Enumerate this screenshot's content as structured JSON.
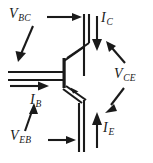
{
  "figure": {
    "device": "pnp-bipolar-junction-transistor",
    "stroke_color": "#1a1a1a",
    "background_color": "#ffffff",
    "width": 153,
    "height": 163,
    "labels": [
      {
        "id": "vbc",
        "symbol": "V",
        "subscript": "BC",
        "text": "VBC",
        "kind": "voltage",
        "meaning": "base-to-collector voltage",
        "arrow": "horizontal-right-into-collector-rail, plus diagonal down-left pointer"
      },
      {
        "id": "ic",
        "symbol": "I",
        "subscript": "C",
        "text": "IC",
        "kind": "current",
        "meaning": "collector current",
        "arrow": "vertical-down"
      },
      {
        "id": "vce",
        "symbol": "V",
        "subscript": "CE",
        "text": "VCE",
        "kind": "voltage",
        "meaning": "collector-to-emitter voltage",
        "arrow": "double-headed leader, up-left to collector and down-left to emitter"
      },
      {
        "id": "ib",
        "symbol": "I",
        "subscript": "B",
        "text": "IB",
        "kind": "current",
        "meaning": "base current",
        "arrow": "horizontal-right"
      },
      {
        "id": "ie",
        "symbol": "I",
        "subscript": "E",
        "text": "IE",
        "kind": "current",
        "meaning": "emitter current",
        "arrow": "vertical-up"
      },
      {
        "id": "veb",
        "symbol": "V",
        "subscript": "EB",
        "text": "VEB",
        "kind": "voltage",
        "meaning": "emitter-to-base voltage",
        "arrow": "horizontal-right-into-emitter-rail, plus diagonal up-right pointer"
      }
    ],
    "terminals": [
      {
        "id": "collector",
        "name": "collector",
        "position": "top-right-rail"
      },
      {
        "id": "base",
        "name": "base",
        "position": "left-rail"
      },
      {
        "id": "emitter",
        "name": "emitter",
        "position": "bottom-right-rail"
      }
    ]
  }
}
